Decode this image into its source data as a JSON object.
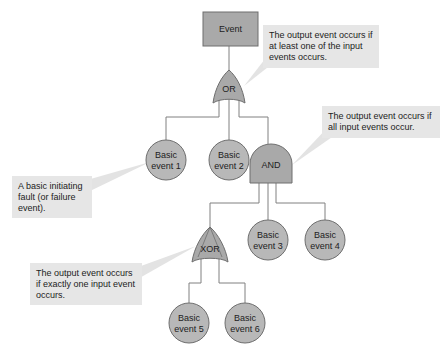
{
  "diagram": {
    "type": "fault-tree",
    "colors": {
      "node_fill": "#a9a9a9",
      "circle_fill": "#b8b8b8",
      "stroke": "#6e6e6e",
      "line": "#808080",
      "callout_fill": "#e6e6e6"
    },
    "top_event": {
      "label": "Event"
    },
    "gates": {
      "or": {
        "label": "OR"
      },
      "and": {
        "label": "AND"
      },
      "xor": {
        "label": "XOR"
      }
    },
    "basic_events": [
      {
        "line1": "Basic",
        "line2": "event 1"
      },
      {
        "line1": "Basic",
        "line2": "event 2"
      },
      {
        "line1": "Basic",
        "line2": "event 3"
      },
      {
        "line1": "Basic",
        "line2": "event 4"
      },
      {
        "line1": "Basic",
        "line2": "event 5"
      },
      {
        "line1": "Basic",
        "line2": "event 6"
      }
    ],
    "callouts": {
      "or": "The output event occurs if at least one of the input events occurs.",
      "and": "The output event occurs if all input events occur.",
      "basic": "A basic initiating fault (or failure event).",
      "xor": "The output event occurs if exactly one input event occurs."
    }
  }
}
